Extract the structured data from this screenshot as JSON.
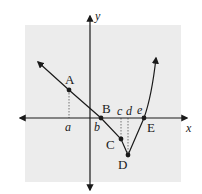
{
  "colors": {
    "background": "#ffffff",
    "panel": "#ececec",
    "ink": "#1a1a1a",
    "dotted": "#666666"
  },
  "axes": {
    "x_label": "x",
    "y_label": "y"
  },
  "points": [
    {
      "id": "A",
      "label": "A"
    },
    {
      "id": "B",
      "label": "B"
    },
    {
      "id": "C",
      "label": "C"
    },
    {
      "id": "D",
      "label": "D"
    },
    {
      "id": "E",
      "label": "E"
    }
  ],
  "x_markers": [
    {
      "id": "a",
      "label": "a"
    },
    {
      "id": "b",
      "label": "b"
    },
    {
      "id": "c",
      "label": "c"
    },
    {
      "id": "d",
      "label": "d"
    },
    {
      "id": "e",
      "label": "e"
    }
  ]
}
